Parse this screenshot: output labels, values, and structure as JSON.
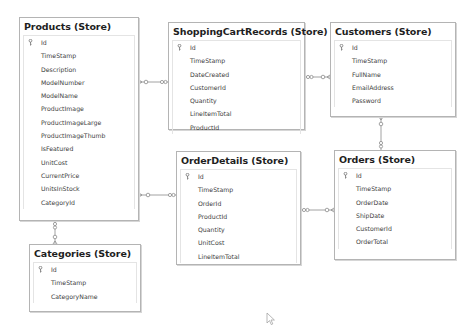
{
  "diagram": {
    "entities": {
      "products": {
        "title": "Products (Store)",
        "fields": [
          "Id",
          "TimeStamp",
          "Description",
          "ModelNumber",
          "ModelName",
          "ProductImage",
          "ProductImageLarge",
          "ProductImageThumb",
          "IsFeatured",
          "UnitCost",
          "CurrentPrice",
          "UnitsInStock",
          "CategoryId"
        ]
      },
      "shoppingCartRecords": {
        "title": "ShoppingCartRecords (Store)",
        "fields": [
          "Id",
          "TimeStamp",
          "DateCreated",
          "CustomerId",
          "Quantity",
          "LineItemTotal",
          "ProductId"
        ]
      },
      "customers": {
        "title": "Customers (Store)",
        "fields": [
          "Id",
          "TimeStamp",
          "FullName",
          "EmailAddress",
          "Password"
        ]
      },
      "orderDetails": {
        "title": "OrderDetails (Store)",
        "fields": [
          "Id",
          "TimeStamp",
          "OrderId",
          "ProductId",
          "Quantity",
          "UnitCost",
          "LineItemTotal"
        ]
      },
      "orders": {
        "title": "Orders (Store)",
        "fields": [
          "Id",
          "TimeStamp",
          "OrderDate",
          "ShipDate",
          "CustomerId",
          "OrderTotal"
        ]
      },
      "categories": {
        "title": "Categories (Store)",
        "fields": [
          "Id",
          "TimeStamp",
          "CategoryName"
        ]
      }
    },
    "relationships": [
      {
        "from": "Products",
        "to": "ShoppingCartRecords",
        "cardinality": "1-to-many"
      },
      {
        "from": "Customers",
        "to": "ShoppingCartRecords",
        "cardinality": "1-to-many"
      },
      {
        "from": "Products",
        "to": "OrderDetails",
        "cardinality": "1-to-many"
      },
      {
        "from": "Orders",
        "to": "OrderDetails",
        "cardinality": "1-to-many"
      },
      {
        "from": "Customers",
        "to": "Orders",
        "cardinality": "1-to-many"
      },
      {
        "from": "Categories",
        "to": "Products",
        "cardinality": "1-to-many"
      }
    ],
    "colors": {
      "border": "#b4b4b4",
      "line": "#8c8c8c",
      "title_text": "#1e1e1e",
      "field_text": "#3c3c3c",
      "background": "#ffffff"
    }
  }
}
